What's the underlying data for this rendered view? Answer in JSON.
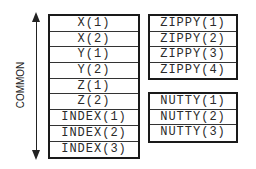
{
  "label": "COMMON",
  "common_block": {
    "rows": [
      "X(1)",
      "X(2)",
      "Y(1)",
      "Y(2)",
      "Z(1)",
      "Z(2)",
      "INDEX(1)",
      "INDEX(2)",
      "INDEX(3)"
    ]
  },
  "zippy_block": {
    "rows": [
      "ZIPPY(1)",
      "ZIPPY(2)",
      "ZIPPY(3)",
      "ZIPPY(4)"
    ]
  },
  "nutty_block": {
    "rows": [
      "NUTTY(1)",
      "NUTTY(2)",
      "NUTTY(3)"
    ]
  },
  "arrow": {
    "direction": "bidirectional-vertical"
  }
}
